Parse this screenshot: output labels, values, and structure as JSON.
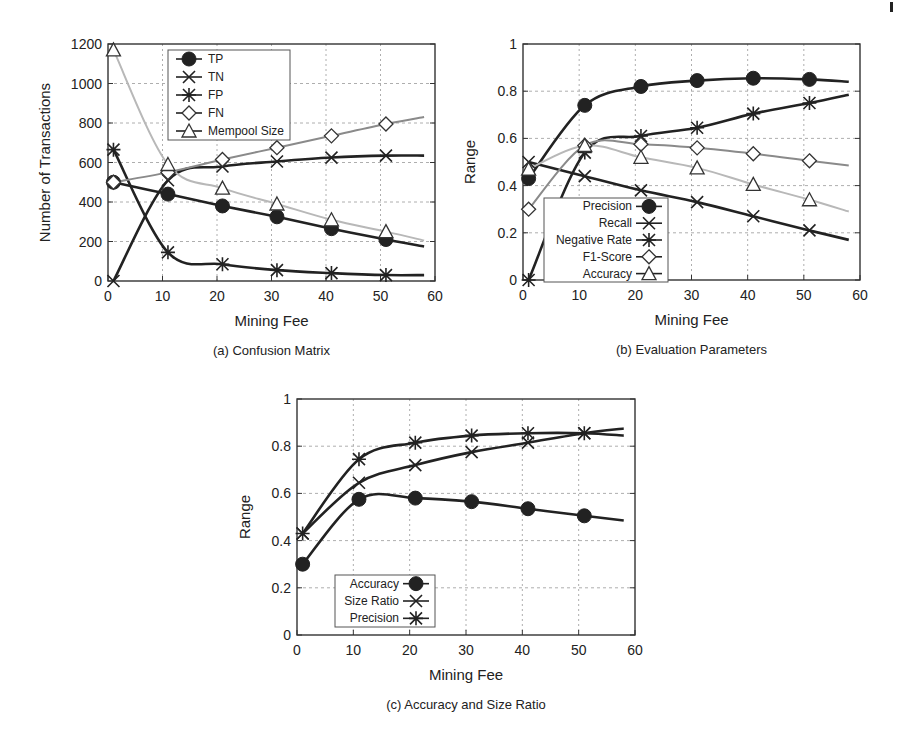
{
  "page": {
    "corner_mark": "|"
  },
  "chart_data": [
    {
      "id": "a",
      "type": "line",
      "title": "",
      "caption": "(a) Confusion Matrix",
      "xlabel": "Mining Fee",
      "ylabel": "Number of Transactions",
      "xlim": [
        0,
        60
      ],
      "ylim": [
        0,
        1200
      ],
      "xticks": [
        0,
        10,
        20,
        30,
        40,
        50,
        60
      ],
      "yticks": [
        0,
        200,
        400,
        600,
        800,
        1000,
        1200
      ],
      "grid": true,
      "legend_position": "upper center",
      "x": [
        1,
        11,
        21,
        31,
        41,
        51
      ],
      "series": [
        {
          "name": "TP",
          "marker": "filled-circle",
          "color": "#222222",
          "values": [
            500,
            440,
            380,
            325,
            265,
            210
          ],
          "curve_end": 175
        },
        {
          "name": "TN",
          "marker": "x",
          "color": "#222222",
          "values": [
            0,
            510,
            580,
            605,
            625,
            635
          ],
          "curve_end": 635
        },
        {
          "name": "FP",
          "marker": "asterisk",
          "color": "#222222",
          "values": [
            665,
            145,
            85,
            55,
            40,
            30
          ],
          "curve_end": 30
        },
        {
          "name": "FN",
          "marker": "diamond",
          "color": "#8a8a8a",
          "values": [
            500,
            550,
            615,
            675,
            735,
            795
          ],
          "curve_end": 830
        },
        {
          "name": "Mempool Size",
          "marker": "triangle",
          "color": "#b8b8b8",
          "values": [
            1170,
            590,
            470,
            390,
            310,
            250
          ],
          "curve_end": 205
        }
      ]
    },
    {
      "id": "b",
      "type": "line",
      "title": "",
      "caption": "(b) Evaluation Parameters",
      "xlabel": "Mining Fee",
      "ylabel": "Range",
      "xlim": [
        0,
        60
      ],
      "ylim": [
        0,
        1
      ],
      "xticks": [
        0,
        10,
        20,
        30,
        40,
        50,
        60
      ],
      "yticks": [
        0,
        0.2,
        0.4,
        0.6,
        0.8,
        1
      ],
      "grid": true,
      "legend_position": "lower left",
      "x": [
        1,
        11,
        21,
        31,
        41,
        51
      ],
      "series": [
        {
          "name": "Precision",
          "marker": "filled-circle",
          "color": "#222222",
          "values": [
            0.43,
            0.74,
            0.82,
            0.845,
            0.855,
            0.85
          ],
          "curve_end": 0.84
        },
        {
          "name": "Recall",
          "marker": "x",
          "color": "#222222",
          "values": [
            0.5,
            0.44,
            0.38,
            0.33,
            0.27,
            0.21
          ],
          "curve_end": 0.17
        },
        {
          "name": "Negative Rate",
          "marker": "asterisk",
          "color": "#222222",
          "values": [
            0.0,
            0.54,
            0.61,
            0.645,
            0.705,
            0.75
          ],
          "curve_end": 0.785
        },
        {
          "name": "F1-Score",
          "marker": "diamond",
          "color": "#8a8a8a",
          "values": [
            0.3,
            0.57,
            0.575,
            0.56,
            0.535,
            0.505
          ],
          "curve_end": 0.485
        },
        {
          "name": "Accuracy",
          "marker": "triangle",
          "color": "#b8b8b8",
          "values": [
            0.47,
            0.57,
            0.52,
            0.475,
            0.405,
            0.34
          ],
          "curve_end": 0.29
        }
      ]
    },
    {
      "id": "c",
      "type": "line",
      "title": "",
      "caption": "(c) Accuracy and Size Ratio",
      "xlabel": "Mining Fee",
      "ylabel": "Range",
      "xlim": [
        0,
        60
      ],
      "ylim": [
        0,
        1
      ],
      "xticks": [
        0,
        10,
        20,
        30,
        40,
        50,
        60
      ],
      "yticks": [
        0,
        0.2,
        0.4,
        0.6,
        0.8,
        1
      ],
      "grid": true,
      "legend_position": "lower left",
      "x": [
        1,
        11,
        21,
        31,
        41,
        51
      ],
      "series": [
        {
          "name": "Accuracy",
          "marker": "filled-circle",
          "color": "#222222",
          "values": [
            0.3,
            0.575,
            0.58,
            0.565,
            0.535,
            0.505
          ],
          "curve_end": 0.485
        },
        {
          "name": "Size Ratio",
          "marker": "x",
          "color": "#222222",
          "values": [
            0.43,
            0.645,
            0.72,
            0.775,
            0.815,
            0.855
          ],
          "curve_end": 0.875
        },
        {
          "name": "Precision",
          "marker": "asterisk",
          "color": "#222222",
          "values": [
            0.43,
            0.745,
            0.815,
            0.845,
            0.855,
            0.855
          ],
          "curve_end": 0.845
        }
      ]
    }
  ]
}
